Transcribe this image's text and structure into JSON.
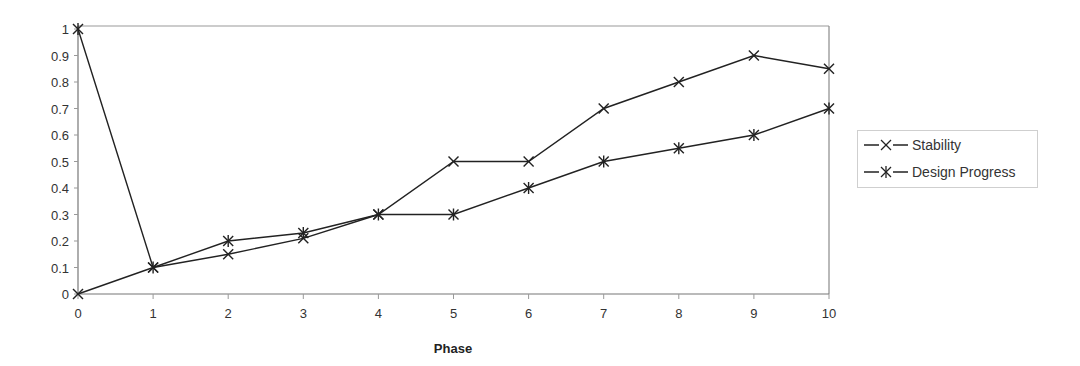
{
  "chart_data": {
    "type": "line",
    "title": "",
    "xlabel": "Phase",
    "ylabel": "",
    "x": [
      0,
      1,
      2,
      3,
      4,
      5,
      6,
      7,
      8,
      9,
      10
    ],
    "xticks": [
      "0",
      "1",
      "2",
      "3",
      "4",
      "5",
      "6",
      "7",
      "8",
      "9",
      "10"
    ],
    "yticks": [
      "0",
      "0.1",
      "0.2",
      "0.3",
      "0.4",
      "0.5",
      "0.6",
      "0.7",
      "0.8",
      "0.9",
      "1"
    ],
    "xlim": [
      0,
      10
    ],
    "ylim": [
      0,
      1
    ],
    "grid": false,
    "legend_position": "right",
    "series": [
      {
        "name": "Stability",
        "marker": "x",
        "color": "#222222",
        "values": [
          0,
          0.1,
          0.15,
          0.21,
          0.3,
          0.5,
          0.5,
          0.7,
          0.8,
          0.9,
          0.85
        ]
      },
      {
        "name": "Design Progress",
        "marker": "asterisk",
        "color": "#222222",
        "values": [
          1,
          0.1,
          0.2,
          0.23,
          0.3,
          0.3,
          0.4,
          0.5,
          0.55,
          0.6,
          0.7
        ]
      }
    ]
  },
  "legend": {
    "items": [
      {
        "label": "Stability"
      },
      {
        "label": "Design Progress"
      }
    ]
  },
  "axes": {
    "x_title": "Phase"
  }
}
